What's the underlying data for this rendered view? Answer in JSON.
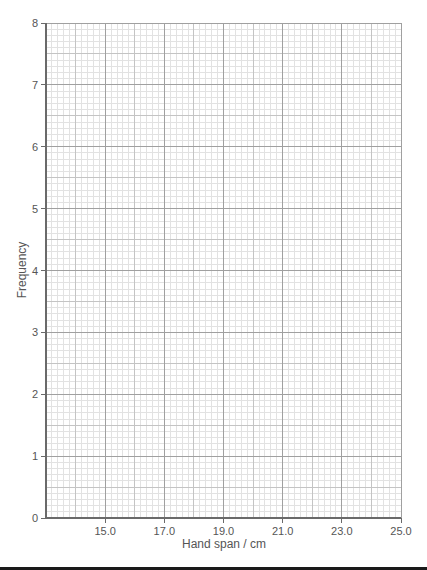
{
  "chart_data": {
    "type": "bar",
    "title": "",
    "xlabel": "Hand span / cm",
    "ylabel": "Frequency",
    "xlim": [
      13.0,
      25.0
    ],
    "ylim": [
      0,
      8
    ],
    "x_ticks": [
      "15.0",
      "17.0",
      "19.0",
      "21.0",
      "23.0",
      "25.0"
    ],
    "x_tick_values": [
      15.0,
      17.0,
      19.0,
      21.0,
      23.0,
      25.0
    ],
    "y_ticks": [
      "0",
      "1",
      "2",
      "3",
      "4",
      "5",
      "6",
      "7",
      "8"
    ],
    "y_tick_values": [
      0,
      1,
      2,
      3,
      4,
      5,
      6,
      7,
      8
    ],
    "grid": true,
    "grid_minor_x_step": 0.2,
    "grid_minor_y_step": 0.1,
    "categories": [],
    "values": [],
    "legend": null,
    "note": "Blank graph paper axes for drawing a histogram; no data plotted"
  },
  "colors": {
    "minor_grid": "#e2e2e2",
    "mid_grid": "#c4c4c4",
    "major_grid": "#a0a0a0",
    "axis": "#6a6a6a",
    "text": "#555555"
  }
}
